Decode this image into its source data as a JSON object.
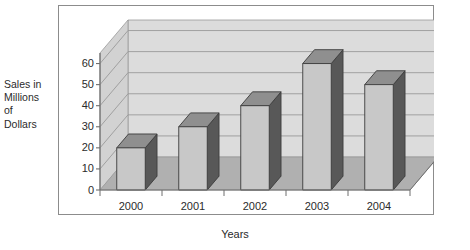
{
  "chart_data": {
    "type": "bar",
    "title": "",
    "subtitle": "",
    "xlabel": "Years",
    "ylabel": "Sales in Millions of Dollars",
    "ylabel_lines": [
      "Sales in",
      "Millions",
      "of",
      "Dollars"
    ],
    "categories": [
      "2000",
      "2001",
      "2002",
      "2003",
      "2004"
    ],
    "values": [
      20,
      30,
      40,
      60,
      50
    ],
    "series": [
      {
        "name": "Sales",
        "values": [
          20,
          30,
          40,
          60,
          50
        ]
      }
    ],
    "ylim": [
      0,
      65
    ],
    "yticks": [
      0,
      10,
      20,
      30,
      40,
      50,
      60
    ],
    "ytick_labels": [
      "0",
      "10",
      "20",
      "30",
      "40",
      "50",
      "60"
    ],
    "grid": true,
    "grid_axis": "y",
    "legend": false,
    "legend_position": "none",
    "three_d": true,
    "annotations": []
  },
  "style": {
    "frame_border": "#8c8c8c",
    "back_wall": "#dcdcdc",
    "side_wall": "#d2d2d2",
    "floor": "#b0b0b0",
    "gridline": "#9a9a9a",
    "bar_front": "#c8c8c8",
    "bar_side": "#585858",
    "bar_top": "#8f8f8f",
    "bar_outline": "#3c3c3c",
    "axis_line": "#6e6e6e",
    "text": "#2b2b2b",
    "background": "#ffffff"
  }
}
